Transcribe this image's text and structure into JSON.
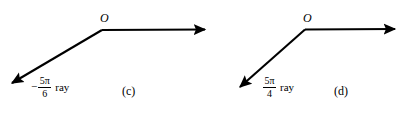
{
  "figure": {
    "background_color": "#ffffff",
    "stroke_color": "#000000",
    "panels": [
      {
        "id": "c",
        "panel_label": "(c)",
        "vertex_label": "O",
        "ray_label": {
          "sign": "−",
          "numerator": "5π",
          "denominator": "6",
          "word": "ray"
        },
        "initial_ray_direction": "right",
        "terminal_ray_direction": "down-left"
      },
      {
        "id": "d",
        "panel_label": "(d)",
        "vertex_label": "O",
        "ray_label": {
          "sign": "",
          "numerator": "5π",
          "denominator": "4",
          "word": "ray"
        },
        "initial_ray_direction": "right",
        "terminal_ray_direction": "down-left"
      }
    ]
  }
}
